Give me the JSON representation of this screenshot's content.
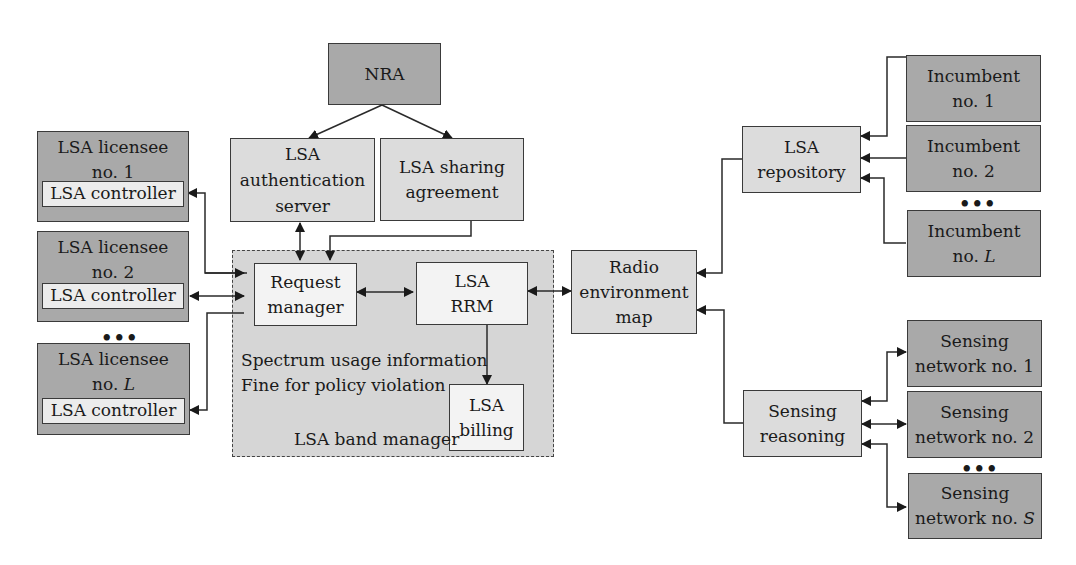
{
  "nodes": {
    "nra": "NRA",
    "auth_server": [
      "LSA",
      "authentication",
      "server"
    ],
    "sharing_agreement": [
      "LSA sharing",
      "agreement"
    ],
    "licensees": [
      {
        "title": "LSA licensee",
        "num": "no. 1",
        "controller": "LSA controller"
      },
      {
        "title": "LSA licensee",
        "num": "no. 2",
        "controller": "LSA controller"
      },
      {
        "title": "LSA licensee",
        "num_prefix": "no. ",
        "num_var": "L",
        "controller": "LSA controller"
      }
    ],
    "request_manager": [
      "Request",
      "manager"
    ],
    "lsa_rrm": [
      "LSA",
      "RRM"
    ],
    "lsa_billing": [
      "LSA",
      "billing"
    ],
    "band_manager_notes": [
      "Spectrum usage information",
      "Fine for policy violation"
    ],
    "band_manager_label": "LSA band manager",
    "rem": [
      "Radio",
      "environment",
      "map"
    ],
    "repository": [
      "LSA",
      "repository"
    ],
    "incumbents": [
      {
        "title": "Incumbent",
        "num": "no. 1"
      },
      {
        "title": "Incumbent",
        "num": "no. 2"
      },
      {
        "title": "Incumbent",
        "num_prefix": "no. ",
        "num_var": "L"
      }
    ],
    "sensing_reasoning": [
      "Sensing",
      "reasoning"
    ],
    "sensing_networks": [
      {
        "title": "Sensing",
        "num": "network no. 1"
      },
      {
        "title": "Sensing",
        "num": "network no. 2"
      },
      {
        "title": "Sensing",
        "num_prefix": "network no. ",
        "num_var": "S"
      }
    ],
    "ellipsis": "•••"
  },
  "colors": {
    "dark_box": "#a9a9a9",
    "light_box": "#dcdcdc",
    "band_manager_bg": "#d6d6d6",
    "white_box": "#f3f3f3",
    "line": "#2a2a2a"
  }
}
